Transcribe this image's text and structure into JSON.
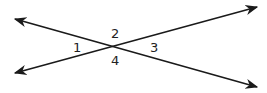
{
  "diagram": {
    "type": "intersecting-lines",
    "line_color": "#1a1a1a",
    "angle_labels": [
      "1",
      "2",
      "3",
      "4"
    ]
  }
}
